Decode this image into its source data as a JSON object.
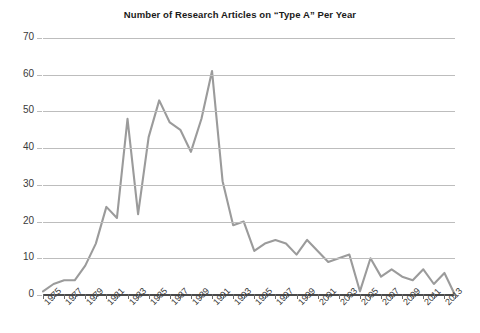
{
  "chart_data": {
    "type": "line",
    "title": "Number of Research Articles on “Type A” Per Year",
    "xlabel": "",
    "ylabel": "",
    "ylim": [
      0,
      70
    ],
    "ytick_values": [
      0,
      10,
      20,
      30,
      40,
      50,
      60,
      70
    ],
    "ytick_labels": [
      "0",
      "10",
      "20",
      "30",
      "40",
      "50",
      "60",
      "70"
    ],
    "xlim": [
      1975,
      2014
    ],
    "xtick_labels": [
      "1975",
      "1977",
      "1979",
      "1981",
      "1983",
      "1985",
      "1987",
      "1989",
      "1991",
      "1993",
      "1995",
      "1997",
      "1999",
      "2001",
      "2003",
      "2005",
      "2007",
      "2009",
      "2011",
      "2013"
    ],
    "grid": true,
    "legend": "none",
    "line_color": "#9b9b9b",
    "line_width": 2.1,
    "categories": [
      1975,
      1976,
      1977,
      1978,
      1979,
      1980,
      1981,
      1982,
      1983,
      1984,
      1985,
      1986,
      1987,
      1988,
      1989,
      1990,
      1991,
      1992,
      1993,
      1994,
      1995,
      1996,
      1997,
      1998,
      1999,
      2000,
      2001,
      2002,
      2003,
      2004,
      2005,
      2006,
      2007,
      2008,
      2009,
      2010,
      2011,
      2012,
      2013,
      2014
    ],
    "values": [
      1,
      3,
      4,
      4,
      8,
      14,
      24,
      21,
      48,
      22,
      43,
      53,
      47,
      45,
      39,
      48,
      61,
      31,
      19,
      20,
      12,
      14,
      15,
      14,
      11,
      15,
      12,
      9,
      10,
      11,
      1,
      10,
      5,
      7,
      5,
      4,
      7,
      3,
      6,
      0
    ],
    "series": [
      {
        "name": "Articles per year",
        "values": [
          1,
          3,
          4,
          4,
          8,
          14,
          24,
          21,
          48,
          22,
          43,
          53,
          47,
          45,
          39,
          48,
          61,
          31,
          19,
          20,
          12,
          14,
          15,
          14,
          11,
          15,
          12,
          9,
          10,
          11,
          1,
          10,
          5,
          7,
          5,
          4,
          7,
          3,
          6,
          0
        ]
      }
    ],
    "peak": {
      "year": 1991,
      "value": 61
    }
  }
}
